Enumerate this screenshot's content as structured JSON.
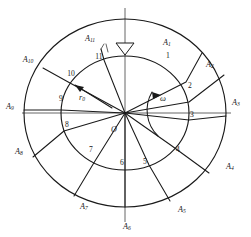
{
  "figure": {
    "center_label": "O",
    "radius_label": "r",
    "radius_label_sub": "0",
    "angle_label": "ω",
    "top_marker": "hollow-down-triangle"
  },
  "colors": {
    "ink": "#1a1a1a",
    "thin_ink": "#3a3a3a",
    "axis": "#555555",
    "background": "#ffffff"
  },
  "geometry": {
    "outer_circle": {
      "cx": 125,
      "cy": 113,
      "rx": 101,
      "ry": 94
    },
    "inner_circle": {
      "cx": 125,
      "cy": 113,
      "rx": 64,
      "ry": 57
    },
    "vertical_axis": {
      "x": 125,
      "y_top": 8,
      "y_bottom": 222
    },
    "horizontal_axis": {
      "y": 113,
      "x_left": 22,
      "x_right": 231
    }
  },
  "outer_points": [
    {
      "id": "A1",
      "label": "A",
      "sub": "1",
      "angle_deg": 72,
      "lx": 167,
      "ly": 43
    },
    {
      "id": "A2",
      "label": "A",
      "sub": "2",
      "angle_deg": 40,
      "lx": 210,
      "ly": 65
    },
    {
      "id": "A3",
      "label": "A",
      "sub": "3",
      "angle_deg": 2,
      "lx": 234,
      "ly": 103
    },
    {
      "id": "A4",
      "label": "A",
      "sub": "4",
      "angle_deg": -38,
      "lx": 228,
      "ly": 165
    },
    {
      "id": "A5",
      "label": "A",
      "sub": "5",
      "angle_deg": -70,
      "lx": 182,
      "ly": 209
    },
    {
      "id": "A6",
      "label": "A",
      "sub": "6",
      "angle_deg": -90,
      "lx": 127,
      "ly": 226
    },
    {
      "id": "A7",
      "label": "A",
      "sub": "7",
      "angle_deg": -118,
      "lx": 85,
      "ly": 206
    },
    {
      "id": "A8",
      "label": "A",
      "sub": "8",
      "angle_deg": -152,
      "lx": 19,
      "ly": 152
    },
    {
      "id": "A9",
      "label": "A",
      "sub": "9",
      "angle_deg": 181,
      "lx": 9,
      "ly": 107
    },
    {
      "id": "A10",
      "label": "A",
      "sub": "10",
      "angle_deg": 144,
      "lx": 28,
      "ly": 60
    },
    {
      "id": "A11",
      "label": "A",
      "sub": "11",
      "angle_deg": 104,
      "lx": 90,
      "ly": 39
    }
  ],
  "inner_points": [
    {
      "id": "n1",
      "label": "1",
      "lx": 168,
      "ly": 56
    },
    {
      "id": "n2",
      "label": "2",
      "lx": 190,
      "ly": 86
    },
    {
      "id": "n3",
      "label": "3",
      "lx": 192,
      "ly": 114
    },
    {
      "id": "n4",
      "label": "4",
      "lx": 178,
      "ly": 150
    },
    {
      "id": "n5",
      "label": "5",
      "lx": 145,
      "ly": 162
    },
    {
      "id": "n6",
      "label": "6",
      "lx": 123,
      "ly": 163
    },
    {
      "id": "n7",
      "label": "7",
      "lx": 91,
      "ly": 150
    },
    {
      "id": "n8",
      "label": "8",
      "lx": 67,
      "ly": 125
    },
    {
      "id": "n9",
      "label": "9",
      "lx": 61,
      "ly": 99
    },
    {
      "id": "n10",
      "label": "10",
      "lx": 70,
      "ly": 74
    },
    {
      "id": "n11",
      "label": "11",
      "lx": 99,
      "ly": 57
    }
  ]
}
